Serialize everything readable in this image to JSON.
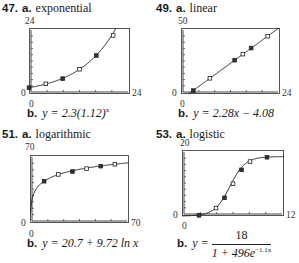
{
  "chart_data": [
    {
      "id": "47",
      "type": "scatter",
      "title": "exponential",
      "model": "exponential",
      "xlim": [
        0,
        24
      ],
      "ylim": [
        0,
        24
      ],
      "x_tick_label_min": "0",
      "x_tick_label_max": "24",
      "y_tick_label_min": "0",
      "y_tick_label_max": "24",
      "grid": false,
      "points": [
        [
          0,
          2.3
        ],
        [
          4,
          3.7
        ],
        [
          8,
          5.6
        ],
        [
          12,
          9.0
        ],
        [
          16,
          14.0
        ],
        [
          20,
          21.3
        ]
      ],
      "equation": "y = 2.3(1.12)^x"
    },
    {
      "id": "49",
      "type": "scatter",
      "title": "linear",
      "model": "linear",
      "xlim": [
        0,
        24
      ],
      "ylim": [
        0,
        50
      ],
      "x_tick_label_min": "0",
      "x_tick_label_max": "24",
      "y_tick_label_min": "0",
      "y_tick_label_max": "50",
      "grid": false,
      "points": [
        [
          3,
          2.6
        ],
        [
          7,
          11.9
        ],
        [
          13,
          25.6
        ],
        [
          15,
          30.2
        ],
        [
          17,
          34.8
        ],
        [
          21,
          43.8
        ]
      ],
      "equation": "y = 2.28x − 4.08"
    },
    {
      "id": "51",
      "type": "scatter",
      "title": "logarithmic",
      "model": "logarithmic",
      "xlim": [
        0,
        70
      ],
      "ylim": [
        0,
        70
      ],
      "x_tick_label_min": "0",
      "x_tick_label_max": "70",
      "y_tick_label_min": "0",
      "y_tick_label_max": "70",
      "grid": false,
      "points": [
        [
          10,
          43
        ],
        [
          20,
          50
        ],
        [
          30,
          53
        ],
        [
          40,
          56
        ],
        [
          50,
          58.5
        ],
        [
          60,
          60.5
        ]
      ],
      "equation": "y = 20.7 + 9.72 ln x"
    },
    {
      "id": "53",
      "type": "scatter",
      "title": "logistic",
      "model": "logistic",
      "xlim": [
        0,
        12
      ],
      "ylim": [
        0,
        20
      ],
      "x_tick_label_min": "0",
      "x_tick_label_max": "12",
      "y_tick_label_min": "0",
      "y_tick_label_max": "20",
      "grid": false,
      "points": [
        [
          2,
          0.2
        ],
        [
          4,
          2.4
        ],
        [
          5,
          5.5
        ],
        [
          6,
          9.8
        ],
        [
          7,
          14.0
        ],
        [
          8,
          16.5
        ],
        [
          10,
          17.8
        ]
      ],
      "equation_parts": {
        "lhs": "y =",
        "numerator": "18",
        "denominator_base": "1 + 496e",
        "exponent": "−1.1x"
      }
    }
  ],
  "panels": [
    {
      "number": "47.",
      "part_a": "a.",
      "label": "exponential",
      "ymax": "24",
      "ymin": "0",
      "xmin": "0",
      "xmax": "24",
      "part_b": "b.",
      "eq_prefix": "y = 2.3(1.12)",
      "eq_sup": "x"
    },
    {
      "number": "49.",
      "part_a": "a.",
      "label": "linear",
      "ymax": "50",
      "ymin": "0",
      "xmin": "0",
      "xmax": "24",
      "part_b": "b.",
      "eq_prefix": "y = 2.28x − 4.08"
    },
    {
      "number": "51.",
      "part_a": "a.",
      "label": "logarithmic",
      "ymax": "70",
      "ymin": "0",
      "xmin": "0",
      "xmax": "70",
      "part_b": "b.",
      "eq_prefix": "y = 20.7 + 9.72 ln x"
    },
    {
      "number": "53.",
      "part_a": "a.",
      "label": "logistic",
      "ymax": "20",
      "ymin": "0",
      "xmin": "0",
      "xmax": "12",
      "part_b": "b.",
      "eq_lhs": "y =",
      "eq_num": "18",
      "eq_den": "1 + 496e",
      "eq_den_sup": "−1.1x"
    }
  ]
}
